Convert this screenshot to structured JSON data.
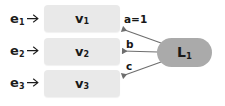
{
  "diagram": {
    "background_color": "#ffffff",
    "box_color": "#e9e9e9",
    "node_color": "#aaaaaa",
    "text_color": "#1a1a1a",
    "line_color": "#6e6e6e",
    "sources": [
      {
        "base": "e",
        "sub": "1",
        "arrow_icon": "arrow-right-icon"
      },
      {
        "base": "e",
        "sub": "2",
        "arrow_icon": "arrow-right-icon"
      },
      {
        "base": "e",
        "sub": "3",
        "arrow_icon": "arrow-right-icon"
      }
    ],
    "vertices": [
      {
        "base": "v",
        "sub": "1"
      },
      {
        "base": "v",
        "sub": "2"
      },
      {
        "base": "v",
        "sub": "3"
      }
    ],
    "edges": [
      {
        "label": "a=1",
        "from": "L1",
        "to": "v1"
      },
      {
        "label": "b",
        "from": "L1",
        "to": "v2"
      },
      {
        "label": "c",
        "from": "L1",
        "to": "v3"
      }
    ],
    "node": {
      "base": "L",
      "sub": "1"
    }
  }
}
